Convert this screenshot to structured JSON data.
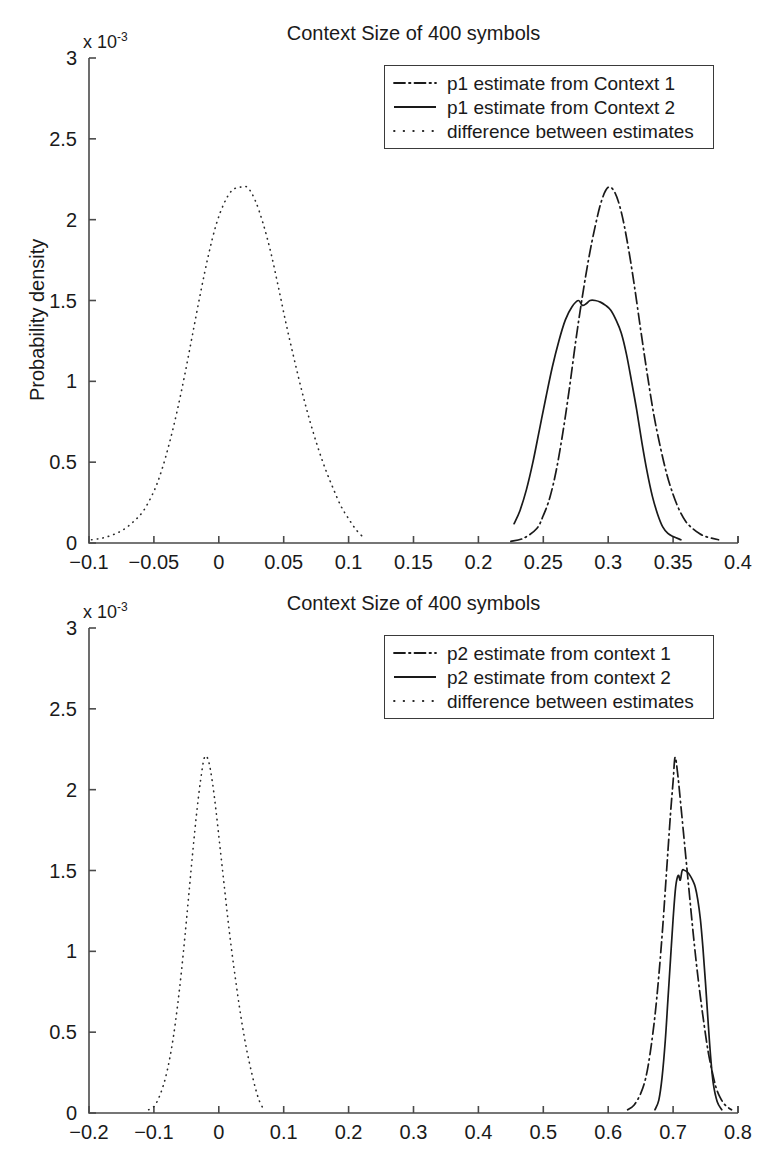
{
  "figure": {
    "background_color": "#ffffff",
    "line_color": "#1a1a1a",
    "axis_color": "#4a4a4a"
  },
  "chart_data": [
    {
      "type": "line",
      "id": "panel-top",
      "title": "Context Size of 400 symbols",
      "xlabel": "",
      "ylabel": "Probability density",
      "y_exponent_label": "x 10",
      "y_exponent_power": "-3",
      "xlim": [
        -0.1,
        0.4
      ],
      "ylim": [
        0,
        3
      ],
      "grid": false,
      "legend_position": "top-right",
      "xticks": [
        "-0.1",
        "-0.05",
        "0",
        "0.05",
        "0.1",
        "0.15",
        "0.2",
        "0.25",
        "0.3",
        "0.35",
        "0.4"
      ],
      "xtick_values": [
        -0.1,
        -0.05,
        0,
        0.05,
        0.1,
        0.15,
        0.2,
        0.25,
        0.3,
        0.35,
        0.4
      ],
      "yticks": [
        "0",
        "0.5",
        "1",
        "1.5",
        "2",
        "2.5",
        "3"
      ],
      "ytick_values": [
        0,
        0.5,
        1,
        1.5,
        2,
        2.5,
        3
      ],
      "series": [
        {
          "name": "p1 estimate from Context 1",
          "style": "dashdot",
          "peak_x": 0.3,
          "peak_y": 2.2,
          "x": [
            0.225,
            0.235,
            0.245,
            0.25,
            0.255,
            0.26,
            0.265,
            0.27,
            0.275,
            0.28,
            0.285,
            0.29,
            0.295,
            0.3,
            0.305,
            0.31,
            0.315,
            0.32,
            0.325,
            0.33,
            0.335,
            0.34,
            0.345,
            0.35,
            0.355,
            0.36,
            0.365,
            0.37,
            0.375,
            0.385
          ],
          "y": [
            0.01,
            0.03,
            0.09,
            0.17,
            0.28,
            0.45,
            0.68,
            0.95,
            1.25,
            1.52,
            1.76,
            1.96,
            2.12,
            2.2,
            2.17,
            2.05,
            1.85,
            1.6,
            1.32,
            1.05,
            0.8,
            0.6,
            0.43,
            0.3,
            0.2,
            0.13,
            0.09,
            0.06,
            0.04,
            0.02
          ]
        },
        {
          "name": "p1 estimate from Context 2",
          "style": "solid",
          "peak_x": 0.285,
          "peak_y": 1.5,
          "x": [
            0.2275,
            0.232,
            0.237,
            0.242,
            0.247,
            0.252,
            0.257,
            0.262,
            0.267,
            0.272,
            0.277,
            0.28,
            0.283,
            0.286,
            0.29,
            0.294,
            0.298,
            0.302,
            0.306,
            0.31,
            0.314,
            0.318,
            0.322,
            0.326,
            0.33,
            0.334,
            0.338,
            0.342,
            0.346,
            0.35,
            0.356
          ],
          "y": [
            0.12,
            0.2,
            0.33,
            0.5,
            0.7,
            0.9,
            1.09,
            1.25,
            1.38,
            1.46,
            1.5,
            1.47,
            1.48,
            1.5,
            1.5,
            1.49,
            1.47,
            1.44,
            1.38,
            1.3,
            1.17,
            1.0,
            0.82,
            0.62,
            0.44,
            0.29,
            0.18,
            0.1,
            0.06,
            0.04,
            0.02
          ]
        },
        {
          "name": "difference between estimates",
          "style": "dotted",
          "peak_x": 0.022,
          "peak_y": 2.2,
          "x": [
            -0.098,
            -0.09,
            -0.082,
            -0.074,
            -0.066,
            -0.058,
            -0.05,
            -0.044,
            -0.038,
            -0.032,
            -0.026,
            -0.02,
            -0.014,
            -0.008,
            -0.002,
            0.004,
            0.01,
            0.016,
            0.022,
            0.028,
            0.034,
            0.04,
            0.046,
            0.052,
            0.058,
            0.064,
            0.07,
            0.076,
            0.082,
            0.088,
            0.094,
            0.1,
            0.106,
            0.112
          ],
          "y": [
            0.02,
            0.03,
            0.05,
            0.08,
            0.13,
            0.2,
            0.32,
            0.45,
            0.62,
            0.82,
            1.05,
            1.3,
            1.55,
            1.78,
            1.97,
            2.1,
            2.18,
            2.2,
            2.2,
            2.12,
            1.98,
            1.8,
            1.58,
            1.35,
            1.14,
            0.94,
            0.76,
            0.6,
            0.46,
            0.34,
            0.23,
            0.15,
            0.08,
            0.03
          ]
        }
      ]
    },
    {
      "type": "line",
      "id": "panel-bottom",
      "title": "Context Size of 400 symbols",
      "xlabel": "",
      "ylabel": "",
      "y_exponent_label": "x 10",
      "y_exponent_power": "-3",
      "xlim": [
        -0.2,
        0.8
      ],
      "ylim": [
        0,
        3
      ],
      "grid": false,
      "legend_position": "top-right",
      "xticks": [
        "-0.2",
        "-0.1",
        "0",
        "0.1",
        "0.2",
        "0.3",
        "0.4",
        "0.5",
        "0.6",
        "0.7",
        "0.8"
      ],
      "xtick_values": [
        -0.2,
        -0.1,
        0,
        0.1,
        0.2,
        0.3,
        0.4,
        0.5,
        0.6,
        0.7,
        0.8
      ],
      "yticks": [
        "0",
        "0.5",
        "1",
        "1.5",
        "2",
        "2.5",
        "3"
      ],
      "ytick_values": [
        0,
        0.5,
        1,
        1.5,
        2,
        2.5,
        3
      ],
      "series": [
        {
          "name": "p2 estimate from context 1",
          "style": "dashdot",
          "peak_x": 0.703,
          "peak_y": 2.2,
          "x": [
            0.63,
            0.64,
            0.65,
            0.658,
            0.665,
            0.672,
            0.678,
            0.684,
            0.69,
            0.696,
            0.7,
            0.703,
            0.707,
            0.712,
            0.718,
            0.724,
            0.73,
            0.736,
            0.742,
            0.748,
            0.754,
            0.76,
            0.766,
            0.772,
            0.78,
            0.79
          ],
          "y": [
            0.02,
            0.05,
            0.12,
            0.22,
            0.38,
            0.6,
            0.85,
            1.15,
            1.5,
            1.85,
            2.05,
            2.2,
            2.1,
            1.9,
            1.65,
            1.4,
            1.15,
            0.92,
            0.72,
            0.54,
            0.38,
            0.26,
            0.16,
            0.1,
            0.05,
            0.02
          ]
        },
        {
          "name": "p2 estimate from context 2",
          "style": "solid",
          "peak_x": 0.712,
          "peak_y": 1.5,
          "x": [
            0.672,
            0.678,
            0.683,
            0.688,
            0.692,
            0.696,
            0.7,
            0.704,
            0.708,
            0.711,
            0.714,
            0.718,
            0.722,
            0.726,
            0.73,
            0.734,
            0.738,
            0.742,
            0.746,
            0.75,
            0.754,
            0.758,
            0.762,
            0.768,
            0.775
          ],
          "y": [
            0.02,
            0.08,
            0.22,
            0.45,
            0.7,
            0.95,
            1.2,
            1.4,
            1.47,
            1.44,
            1.5,
            1.5,
            1.49,
            1.47,
            1.44,
            1.4,
            1.32,
            1.2,
            1.02,
            0.8,
            0.56,
            0.34,
            0.18,
            0.07,
            0.02
          ]
        },
        {
          "name": "difference between estimates",
          "style": "dotted",
          "peak_x": -0.02,
          "peak_y": 2.2,
          "x": [
            -0.108,
            -0.1,
            -0.094,
            -0.088,
            -0.082,
            -0.076,
            -0.07,
            -0.064,
            -0.058,
            -0.052,
            -0.046,
            -0.04,
            -0.034,
            -0.028,
            -0.022,
            -0.016,
            -0.01,
            -0.004,
            0.002,
            0.008,
            0.014,
            0.02,
            0.026,
            0.032,
            0.038,
            0.044,
            0.05,
            0.056,
            0.062,
            0.068
          ],
          "y": [
            0.02,
            0.04,
            0.08,
            0.14,
            0.22,
            0.33,
            0.47,
            0.65,
            0.86,
            1.1,
            1.36,
            1.62,
            1.86,
            2.06,
            2.2,
            2.18,
            2.05,
            1.86,
            1.64,
            1.42,
            1.2,
            1.0,
            0.82,
            0.65,
            0.5,
            0.37,
            0.26,
            0.16,
            0.08,
            0.03
          ]
        }
      ]
    }
  ]
}
